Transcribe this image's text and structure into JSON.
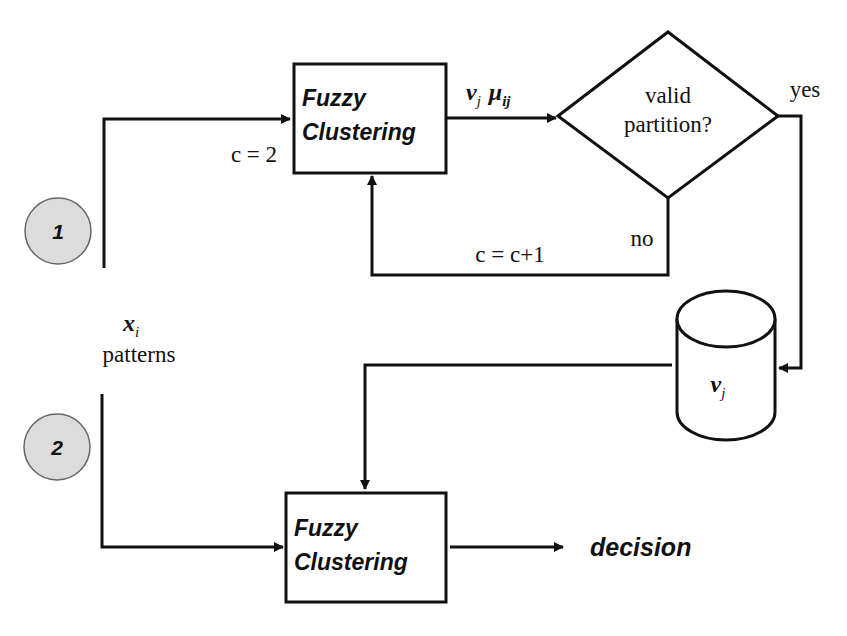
{
  "diagram": {
    "type": "flowchart",
    "colors": {
      "stroke": "#111111",
      "background": "#ffffff",
      "step_circle_fill": "#dcdcdc"
    },
    "steps": [
      {
        "id": "step-1",
        "label": "1"
      },
      {
        "id": "step-2",
        "label": "2"
      }
    ],
    "input": {
      "symbol_base": "x",
      "symbol_sub": "i",
      "label": "patterns"
    },
    "top_box": {
      "line1": "Fuzzy",
      "line2": "Clustering"
    },
    "bottom_box": {
      "line1": "Fuzzy",
      "line2": "Clustering"
    },
    "init_label": "c = 2",
    "output_labels": {
      "v_base": "v",
      "v_sub": "j",
      "mu_base": "μ",
      "mu_sub": "ij"
    },
    "decision": {
      "line1": "valid",
      "line2": "partition?"
    },
    "yes_label": "yes",
    "no_label": "no",
    "increment_label": "c = c+1",
    "storage": {
      "symbol_base": "v",
      "symbol_sub": "j"
    },
    "final_output": "decision"
  }
}
